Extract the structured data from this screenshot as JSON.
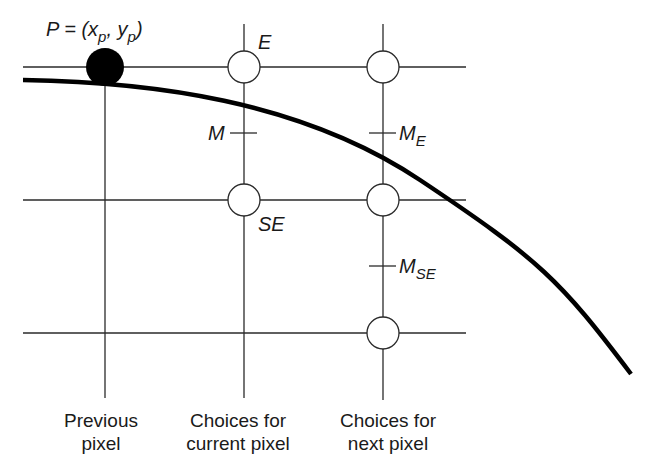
{
  "labels": {
    "point_p": "P = (x",
    "point_p_sub_x": "p",
    "point_p_mid": ", y",
    "point_p_sub_y": "p",
    "point_p_close": ")",
    "e": "E",
    "se": "SE",
    "m": "M",
    "m_e": "M",
    "m_e_sub": "E",
    "m_se": "M",
    "m_se_sub": "SE"
  },
  "captions": {
    "previous_line1": "Previous",
    "previous_line2": "pixel",
    "current_line1": "Choices for",
    "current_line2": "current pixel",
    "next_line1": "Choices for",
    "next_line2": "next pixel"
  },
  "colors": {
    "line": "#2a2a2a",
    "curve": "#000000",
    "filled_pixel": "#000000",
    "empty_pixel": "#ffffff"
  }
}
